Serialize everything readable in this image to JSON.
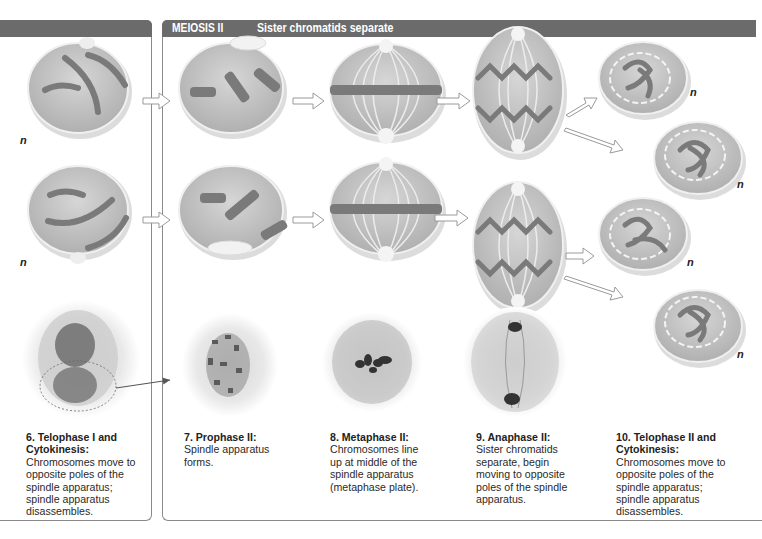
{
  "header": {
    "section_label": "MEIOSIS II",
    "section_subtitle": "Sister chromatids separate"
  },
  "stages": [
    {
      "title": "6. Telophase I and Cytokinesis:",
      "description": "Chromosomes move to opposite poles of the spindle apparatus; spindle apparatus disassembles."
    },
    {
      "title": "7. Prophase II:",
      "description": "Spindle apparatus forms."
    },
    {
      "title": "8. Metaphase II:",
      "description": "Chromosomes line up at middle of the spindle apparatus (metaphase plate)."
    },
    {
      "title": "9. Anaphase II:",
      "description": "Sister chromatids separate, begin moving to opposite poles of the spindle apparatus."
    },
    {
      "title": "10. Telophase II and Cytokinesis:",
      "description": "Chromosomes move to opposite poles of the spindle apparatus; spindle apparatus disassembles."
    }
  ],
  "ploidy_label": "n",
  "colors": {
    "header_bg": "#6b6b6b",
    "cell_fill": "#c4c4c4",
    "chromosome": "#7a7a7a",
    "border": "#8a8a8a"
  }
}
